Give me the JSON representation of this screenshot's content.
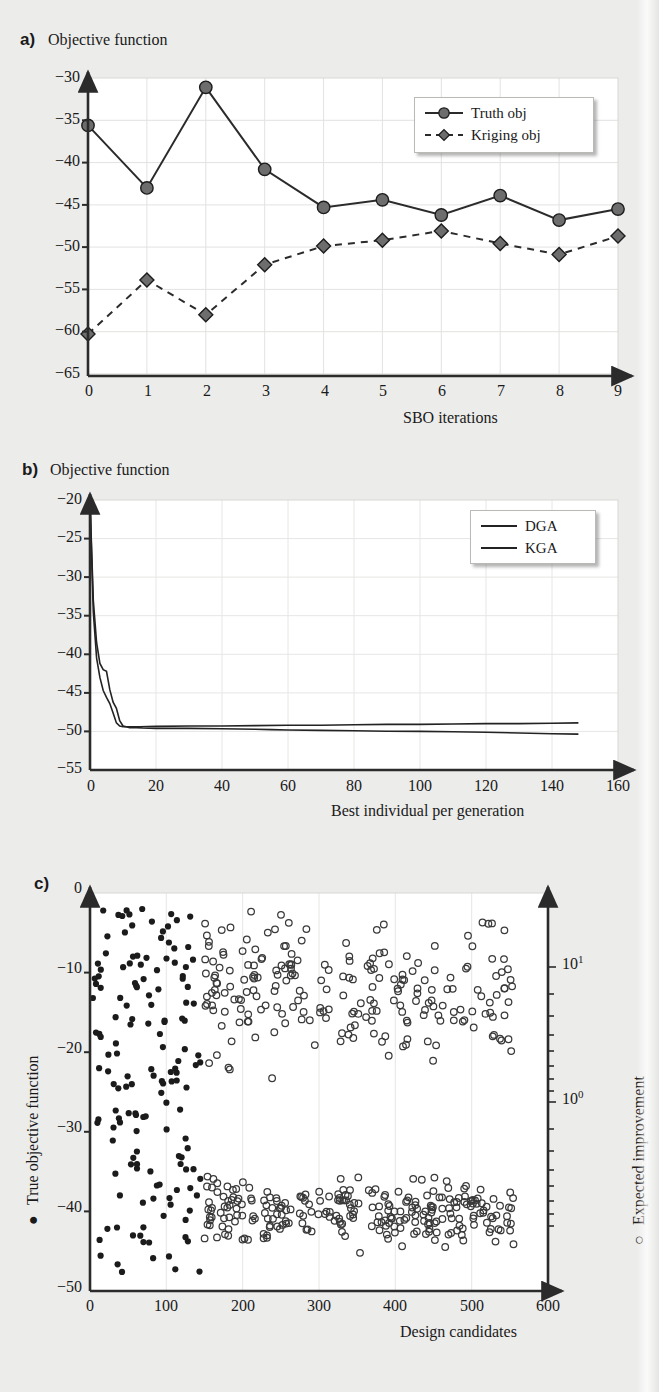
{
  "panels": {
    "a": {
      "letter": "a)",
      "title": "Objective function",
      "xlabel": "SBO iterations"
    },
    "b": {
      "letter": "b)",
      "title": "Objective function",
      "xlabel": "Best individual per generation"
    },
    "c": {
      "letter": "c)",
      "ylabel_left": "True objective function",
      "ylabel_right": "Expected improvement",
      "xlabel": "Design candidates",
      "right_tick_labels": [
        "10",
        "10"
      ],
      "right_tick_exponents": [
        "1",
        "0"
      ]
    }
  },
  "chart_data": [
    {
      "id": "panel-a",
      "type": "line",
      "title": "Objective function",
      "xlabel": "SBO iterations",
      "ylabel": "Objective function",
      "xlim": [
        0,
        9
      ],
      "ylim": [
        -65,
        -30
      ],
      "xticks": [
        0,
        1,
        2,
        3,
        4,
        5,
        6,
        7,
        8,
        9
      ],
      "yticks": [
        -30,
        -35,
        -40,
        -45,
        -50,
        -55,
        -60,
        -65
      ],
      "grid": true,
      "legend_position": "top-right",
      "x": [
        0,
        1,
        2,
        3,
        4,
        5,
        6,
        7,
        8,
        9
      ],
      "series": [
        {
          "name": "Truth obj",
          "marker": "circle",
          "linestyle": "solid",
          "values": [
            -35.6,
            -43.0,
            -31.1,
            -40.8,
            -45.3,
            -44.4,
            -46.2,
            -43.9,
            -46.8,
            -45.5
          ]
        },
        {
          "name": "Kriging obj",
          "marker": "diamond",
          "linestyle": "dashed",
          "values": [
            -60.3,
            -53.9,
            -58.0,
            -52.1,
            -49.9,
            -49.2,
            -48.1,
            -49.6,
            -50.9,
            -48.7
          ]
        }
      ]
    },
    {
      "id": "panel-b",
      "type": "line",
      "title": "Objective function",
      "xlabel": "Best individual per generation",
      "ylabel": "Objective function",
      "xlim": [
        0,
        160
      ],
      "ylim": [
        -55,
        -20
      ],
      "xticks": [
        0,
        20,
        40,
        60,
        80,
        100,
        120,
        140,
        160
      ],
      "yticks": [
        -20,
        -25,
        -30,
        -35,
        -40,
        -45,
        -50,
        -55
      ],
      "grid": true,
      "legend_position": "top-right",
      "series": [
        {
          "name": "DGA",
          "linestyle": "solid",
          "x": [
            0,
            1,
            2,
            3,
            4,
            5,
            6,
            7,
            8,
            9,
            10,
            11,
            12,
            14,
            16,
            20,
            30,
            40,
            50,
            55,
            60,
            70,
            80,
            90,
            100,
            110,
            120,
            130,
            140,
            148
          ],
          "values": [
            -20.0,
            -33.0,
            -38.5,
            -41.2,
            -42.0,
            -42.2,
            -44.6,
            -46.2,
            -47.0,
            -48.6,
            -49.3,
            -49.4,
            -49.5,
            -49.5,
            -49.55,
            -49.6,
            -49.6,
            -49.65,
            -49.7,
            -49.75,
            -49.8,
            -49.85,
            -49.9,
            -49.95,
            -50.0,
            -50.05,
            -50.1,
            -50.2,
            -50.3,
            -50.35
          ]
        },
        {
          "name": "KGA",
          "linestyle": "solid",
          "x": [
            0,
            1,
            2,
            3,
            4,
            5,
            6,
            7,
            8,
            9,
            10,
            12,
            15,
            20,
            30,
            40,
            50,
            60,
            70,
            80,
            90,
            100,
            110,
            120,
            130,
            140,
            148
          ],
          "values": [
            -20.0,
            -34.5,
            -40.5,
            -43.0,
            -44.7,
            -45.6,
            -46.4,
            -47.6,
            -48.9,
            -49.3,
            -49.4,
            -49.4,
            -49.4,
            -49.35,
            -49.3,
            -49.3,
            -49.25,
            -49.2,
            -49.2,
            -49.15,
            -49.1,
            -49.1,
            -49.05,
            -49.0,
            -49.0,
            -48.95,
            -48.9
          ]
        }
      ]
    },
    {
      "id": "panel-c",
      "type": "scatter",
      "xlabel": "Design candidates",
      "ylabel_left": "True objective function",
      "ylabel_right": "Expected improvement",
      "xlim": [
        0,
        600
      ],
      "ylim_left": [
        -50,
        0
      ],
      "ylim_right_log": [
        0.1,
        30
      ],
      "xticks": [
        0,
        100,
        200,
        300,
        400,
        500,
        600
      ],
      "yticks_left": [
        0,
        -10,
        -20,
        -30,
        -40,
        -50
      ],
      "yticks_right": [
        "10^0",
        "10^1"
      ],
      "grid": true,
      "series": [
        {
          "name": "True objective function",
          "marker": "filled-circle",
          "axis": "left",
          "n_points": 150,
          "x_range": [
            5,
            150
          ],
          "y_range": [
            -48,
            -2
          ]
        },
        {
          "name": "Expected improvement",
          "marker": "open-circle",
          "axis": "right",
          "n_points": 450,
          "x_range": [
            150,
            560
          ],
          "y_range": [
            -48,
            -1
          ]
        }
      ]
    }
  ]
}
